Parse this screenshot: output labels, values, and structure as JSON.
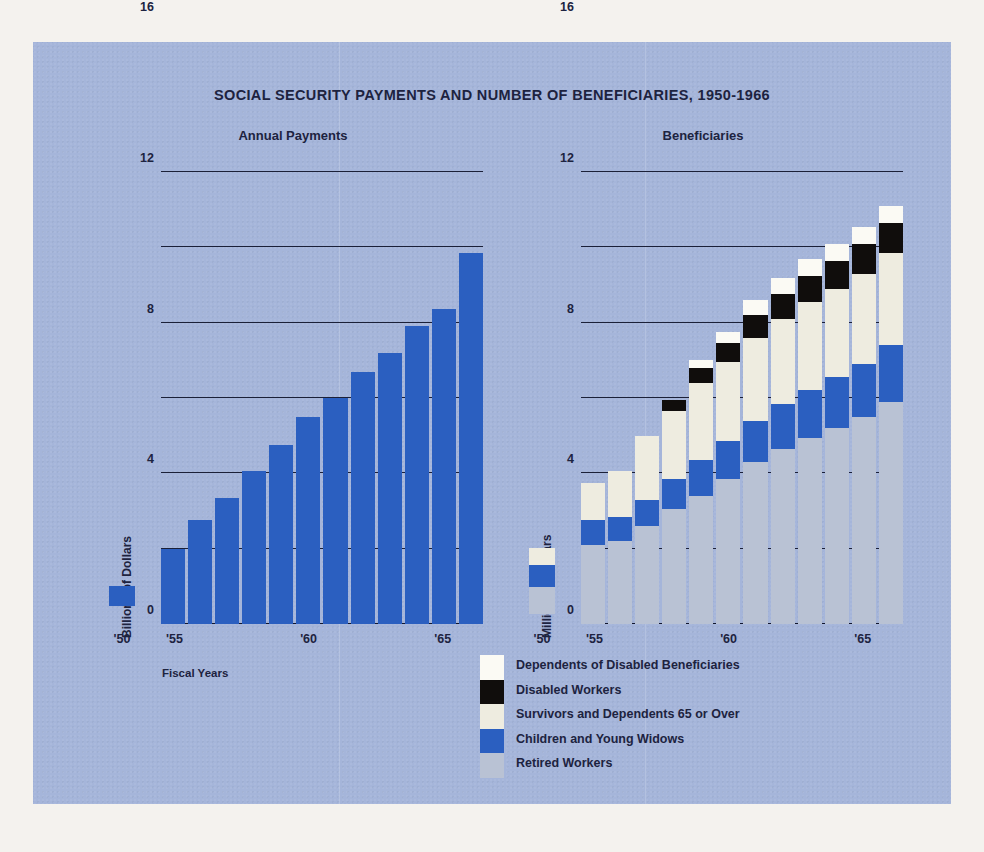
{
  "title": "SOCIAL SECURITY PAYMENTS AND NUMBER OF BENEFICIARIES, 1950-1966",
  "panels": {
    "left": {
      "subtitle": "Annual Payments",
      "ylabel": "Billions of Dollars",
      "xlabel": "Fiscal Years",
      "marker_label": "'50"
    },
    "right": {
      "subtitle": "Beneficiaries",
      "ylabel": "Millions of Dollars",
      "marker_label": "'50"
    }
  },
  "legend": {
    "items": [
      {
        "label": "Dependents of Disabled Beneficiaries",
        "color": "#fbfaf4"
      },
      {
        "label": "Disabled Workers",
        "color": "#100d0c"
      },
      {
        "label": "Survivors and Dependents 65 or Over",
        "color": "#eeece0"
      },
      {
        "label": "Children and Young Widows",
        "color": "#2b5fc0"
      },
      {
        "label": "Retired Workers",
        "color": "#b9c2d4"
      }
    ]
  },
  "colors": {
    "background": "#a5b5da",
    "page": "#f4f2ee",
    "blue": "#2b5fc0",
    "gray": "#b9c2d4",
    "cream": "#eeece0",
    "white": "#fbfaf4",
    "black": "#100d0c",
    "ink": "#1d2340"
  },
  "chart_data": [
    {
      "type": "bar",
      "title": "Annual Payments",
      "xlabel": "Fiscal Years",
      "ylabel": "Billions of Dollars",
      "ylim": [
        0,
        24
      ],
      "yticks": [
        0,
        4,
        8,
        12,
        16,
        20,
        24
      ],
      "ytick_labels": [
        "0",
        "4",
        "8",
        "12",
        "16",
        "20",
        "24"
      ],
      "xticks": [
        "'55",
        "'60",
        "'65"
      ],
      "grid": true,
      "categories": [
        "1955",
        "1956",
        "1957",
        "1958",
        "1959",
        "1960",
        "1961",
        "1962",
        "1963",
        "1964",
        "1965",
        "1966"
      ],
      "values": [
        4.0,
        5.5,
        6.7,
        8.1,
        9.5,
        11.0,
        12.0,
        13.4,
        14.4,
        15.8,
        16.7,
        19.7
      ],
      "reference_marker": {
        "label": "'50",
        "value": 1.0,
        "color": "#2b5fc0"
      }
    },
    {
      "type": "bar",
      "subtype": "stacked",
      "title": "Beneficiaries",
      "ylabel": "Millions of Dollars",
      "ylim": [
        0,
        24
      ],
      "yticks": [
        0,
        4,
        8,
        12,
        16,
        20,
        24
      ],
      "ytick_labels": [
        "0",
        "4",
        "8",
        "12",
        "16",
        "20",
        "24"
      ],
      "xticks": [
        "'55",
        "'60",
        "'65"
      ],
      "grid": true,
      "categories": [
        "1955",
        "1956",
        "1957",
        "1958",
        "1959",
        "1960",
        "1961",
        "1962",
        "1963",
        "1964",
        "1965",
        "1966"
      ],
      "legend_position": "below-center",
      "series": [
        {
          "name": "Retired Workers",
          "color": "#b9c2d4",
          "values": [
            4.2,
            4.4,
            5.2,
            6.1,
            6.8,
            7.7,
            8.6,
            9.3,
            9.9,
            10.4,
            11.0,
            11.8
          ]
        },
        {
          "name": "Children and Young Widows",
          "color": "#2b5fc0",
          "values": [
            1.3,
            1.3,
            1.4,
            1.6,
            1.9,
            2.0,
            2.2,
            2.4,
            2.5,
            2.7,
            2.8,
            3.0
          ]
        },
        {
          "name": "Survivors and Dependents 65 or Over",
          "color": "#eeece0",
          "values": [
            2.0,
            2.4,
            3.4,
            3.6,
            4.1,
            4.2,
            4.4,
            4.5,
            4.7,
            4.7,
            4.8,
            4.9
          ]
        },
        {
          "name": "Disabled Workers",
          "color": "#100d0c",
          "values": [
            0.0,
            0.0,
            0.0,
            0.6,
            0.8,
            1.0,
            1.2,
            1.3,
            1.4,
            1.5,
            1.6,
            1.6
          ]
        },
        {
          "name": "Dependents of Disabled Beneficiaries",
          "color": "#fbfaf4",
          "values": [
            0.0,
            0.0,
            0.0,
            0.0,
            0.4,
            0.6,
            0.8,
            0.9,
            0.9,
            0.9,
            0.9,
            0.9
          ]
        }
      ],
      "reference_marker": {
        "label": "'50",
        "segments": [
          {
            "name": "Retired Workers",
            "value": 1.0,
            "color": "#b9c2d4"
          },
          {
            "name": "Children and Young Widows",
            "value": 0.8,
            "color": "#2b5fc0"
          },
          {
            "name": "Survivors and Dependents 65 or Over",
            "value": 0.6,
            "color": "#eeece0"
          }
        ]
      }
    }
  ]
}
